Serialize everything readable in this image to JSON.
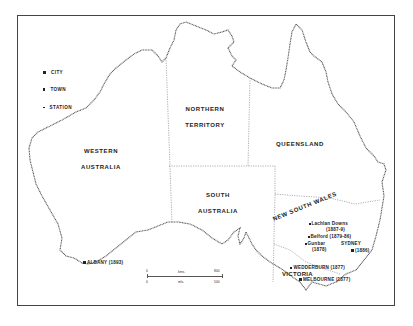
{
  "map": {
    "title": "Australia",
    "legend": [
      {
        "symbol": "city",
        "label": "CITY"
      },
      {
        "symbol": "town",
        "label": "TOWN"
      },
      {
        "symbol": "station",
        "label": "STATION"
      }
    ],
    "regions": {
      "western_australia": [
        "WESTERN",
        "AUSTRALIA"
      ],
      "northern_territory": [
        "NORTHERN",
        "TERRITORY"
      ],
      "queensland": [
        "QUEENSLAND"
      ],
      "south_australia": [
        "SOUTH",
        "AUSTRALIA"
      ],
      "new_south_wales": "NEW SOUTH WALES",
      "victoria": "VICTORIA"
    },
    "places": {
      "albany": "ALBANY (1893)",
      "lachlan_downs": "Lachlan  Downs",
      "lachlan_downs_date": "(1887-9)",
      "belford": "Belford (1879-86)",
      "gunbar": "Gunbar",
      "gunbar_date": "(1878)",
      "sydney": "SYDNEY",
      "sydney_date": "(1886)",
      "wedderburn": "WEDDERBURN (1877)",
      "melbourne": "MELBOURNE (1877)"
    },
    "scale": {
      "km_zero": "0",
      "km_unit": "kms.",
      "km_max": "800",
      "mi_zero": "0",
      "mi_unit": "mls.",
      "mi_max": "500"
    },
    "colors": {
      "ink": "#222222",
      "border": "#888888",
      "background": "#ffffff"
    }
  }
}
